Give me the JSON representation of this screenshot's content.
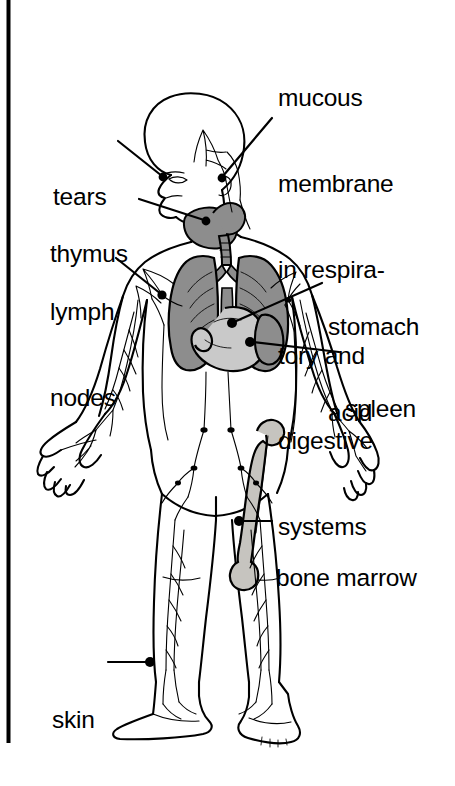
{
  "figure": {
    "kind": "anatomical-diagram",
    "view": "anterior full-body outline, head in three-quarter profile",
    "background_color": "#ffffff",
    "line_color": "#000000"
  },
  "frame": {
    "left_rule": {
      "visible": true,
      "color": "#000000"
    }
  },
  "palette": {
    "ink": "#000000",
    "organ_dark": "#8d8d8d",
    "organ_mid": "#a9a9a9",
    "organ_light": "#c9c9c9",
    "bone_fill": "#c6c4bf",
    "paper": "#ffffff"
  },
  "labels": [
    {
      "id": "mucous-membrane",
      "text": "mucous\nmembrane\nin respira-\ntory and\ndigestive\nsystems",
      "lines": [
        "mucous",
        "membrane",
        "in respira-",
        "tory and",
        "digestive",
        "systems"
      ],
      "side": "right",
      "align": "left"
    },
    {
      "id": "tears",
      "text": "tears",
      "lines": [
        "tears"
      ],
      "side": "left",
      "align": "left"
    },
    {
      "id": "thymus",
      "text": "thymus",
      "lines": [
        "thymus"
      ],
      "side": "left",
      "align": "left"
    },
    {
      "id": "lymph-nodes",
      "text": "lymph\nnodes",
      "lines": [
        "lymph",
        "nodes"
      ],
      "side": "left",
      "align": "left"
    },
    {
      "id": "stomach-acid",
      "text": "stomach\nacid",
      "lines": [
        "stomach",
        "acid"
      ],
      "side": "right",
      "align": "left"
    },
    {
      "id": "spleen",
      "text": "spleen",
      "lines": [
        "spleen"
      ],
      "side": "right",
      "align": "left"
    },
    {
      "id": "bone-marrow",
      "text": "bone marrow",
      "lines": [
        "bone marrow"
      ],
      "side": "right",
      "align": "left"
    },
    {
      "id": "skin",
      "text": "skin",
      "lines": [
        "skin"
      ],
      "side": "left",
      "align": "left"
    }
  ],
  "leader_lines": [
    {
      "for": "tears",
      "style": "diagonal",
      "terminal": "dot"
    },
    {
      "for": "mucous-membrane",
      "style": "diagonal",
      "terminal": "dot"
    },
    {
      "for": "thymus",
      "style": "diagonal",
      "terminal": "dot"
    },
    {
      "for": "lymph-nodes",
      "style": "diagonal",
      "terminal": "dot"
    },
    {
      "for": "stomach-acid",
      "style": "diagonal",
      "terminal": "dot"
    },
    {
      "for": "spleen",
      "style": "diagonal",
      "terminal": "dot"
    },
    {
      "for": "bone-marrow",
      "style": "horizontal",
      "terminal": "dot"
    },
    {
      "for": "skin",
      "style": "horizontal",
      "terminal": "dot"
    }
  ],
  "organs": [
    {
      "id": "lungs",
      "name": "lungs",
      "shade": "dark"
    },
    {
      "id": "trachea",
      "name": "trachea",
      "shade": "dark"
    },
    {
      "id": "thymus-organ",
      "name": "thymus gland",
      "shade": "mid"
    },
    {
      "id": "stomach",
      "name": "stomach",
      "shade": "light"
    },
    {
      "id": "spleen-organ",
      "name": "spleen",
      "shade": "dark"
    },
    {
      "id": "femur",
      "name": "femur with marrow",
      "shade": "bone"
    }
  ]
}
